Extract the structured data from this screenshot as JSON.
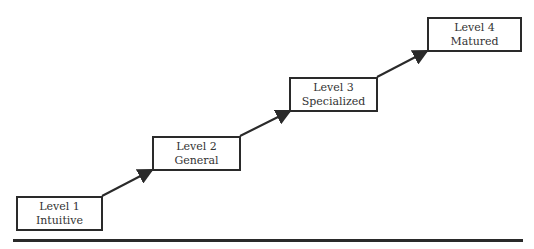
{
  "diagram": {
    "type": "staircase-maturity-model",
    "levels": [
      {
        "level": "Level 1",
        "name": "Intuitive"
      },
      {
        "level": "Level 2",
        "name": "General"
      },
      {
        "level": "Level 3",
        "name": "Specialized"
      },
      {
        "level": "Level 4",
        "name": "Matured"
      }
    ],
    "colors": {
      "stroke": "#2a2a2a",
      "text": "#333333"
    }
  }
}
